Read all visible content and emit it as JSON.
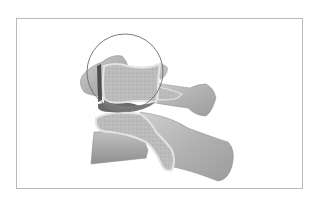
{
  "figure": {
    "type": "anatomical-illustration",
    "has_magnifier_circle": true,
    "colors": {
      "background": "#ffffff",
      "frame_border": "#b9b9b9",
      "bone_surface": "#b4b4b4",
      "bone_light": "#cfcfcf",
      "bone_dark": "#8a8a8a",
      "cancellous_fill": "#bdbdbd",
      "cortical_rim": "#e4e4e4",
      "gap_dark": "#5a5a5a",
      "magnifier_stroke": "#6e6e6e"
    }
  }
}
